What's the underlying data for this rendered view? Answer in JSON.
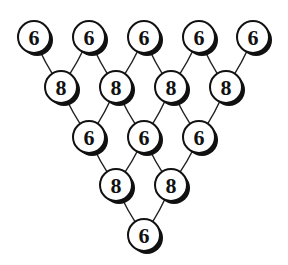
{
  "diagram": {
    "type": "triangular-lattice",
    "node_radius": 16,
    "colors": {
      "stroke": "#111111",
      "fill": "#ffffff",
      "shadow": "#111111"
    },
    "rows": [
      {
        "value": "6",
        "nodes": [
          {
            "x": 34,
            "y": 37
          },
          {
            "x": 89,
            "y": 37
          },
          {
            "x": 144,
            "y": 37
          },
          {
            "x": 199,
            "y": 37
          },
          {
            "x": 253,
            "y": 37
          }
        ]
      },
      {
        "value": "8",
        "nodes": [
          {
            "x": 61,
            "y": 87
          },
          {
            "x": 116,
            "y": 87
          },
          {
            "x": 171,
            "y": 87
          },
          {
            "x": 226,
            "y": 87
          }
        ]
      },
      {
        "value": "6",
        "nodes": [
          {
            "x": 89,
            "y": 137
          },
          {
            "x": 144,
            "y": 137
          },
          {
            "x": 199,
            "y": 137
          }
        ]
      },
      {
        "value": "8",
        "nodes": [
          {
            "x": 116,
            "y": 185
          },
          {
            "x": 171,
            "y": 185
          }
        ]
      },
      {
        "value": "6",
        "nodes": [
          {
            "x": 144,
            "y": 235
          }
        ]
      }
    ],
    "labels": {
      "r0": [
        "6",
        "6",
        "6",
        "6",
        "6"
      ],
      "r1": [
        "8",
        "8",
        "8",
        "8"
      ],
      "r2": [
        "6",
        "6",
        "6"
      ],
      "r3": [
        "8",
        "8"
      ],
      "r4": [
        "6"
      ]
    }
  }
}
